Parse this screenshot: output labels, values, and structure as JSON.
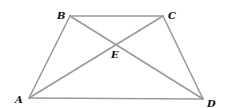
{
  "diagram": {
    "type": "geometry",
    "line_color": "#9a9a9a",
    "label_color": "#111111",
    "points": {
      "A": {
        "label": "A",
        "x": 29,
        "y": 98,
        "label_x": 15,
        "label_y": 103
      },
      "B": {
        "label": "B",
        "x": 70,
        "y": 16,
        "label_x": 57,
        "label_y": 19
      },
      "C": {
        "label": "C",
        "x": 163,
        "y": 16,
        "label_x": 168,
        "label_y": 19
      },
      "D": {
        "label": "D",
        "x": 203,
        "y": 99,
        "label_x": 207,
        "label_y": 107
      },
      "E": {
        "label": "E",
        "x": 116,
        "y": 44,
        "label_x": 111,
        "label_y": 58
      }
    },
    "segments": [
      {
        "name": "AB",
        "from": "A",
        "to": "B"
      },
      {
        "name": "BC",
        "from": "B",
        "to": "C"
      },
      {
        "name": "CD",
        "from": "C",
        "to": "D"
      },
      {
        "name": "DA",
        "from": "D",
        "to": "A"
      },
      {
        "name": "AC",
        "from": "A",
        "to": "C"
      },
      {
        "name": "BD",
        "from": "B",
        "to": "D"
      }
    ]
  }
}
